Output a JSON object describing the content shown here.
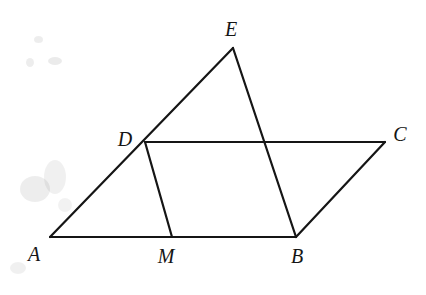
{
  "figure": {
    "canvas": {
      "width": 426,
      "height": 295,
      "background": "#ffffff"
    },
    "stroke_color": "#151515",
    "stroke_width": 2.2,
    "points": {
      "A": {
        "label": "A",
        "x": 50,
        "y": 237,
        "label_x": 34,
        "label_y": 254
      },
      "B": {
        "label": "B",
        "x": 296,
        "y": 237,
        "label_x": 297,
        "label_y": 256
      },
      "C": {
        "label": "C",
        "x": 385,
        "y": 142,
        "label_x": 400,
        "label_y": 134
      },
      "D": {
        "label": "D",
        "x": 145,
        "y": 142,
        "label_x": 125,
        "label_y": 139
      },
      "E": {
        "label": "E",
        "x": 233,
        "y": 48,
        "label_x": 231,
        "label_y": 29
      },
      "M": {
        "label": "M",
        "x": 172,
        "y": 237,
        "label_x": 166,
        "label_y": 256
      }
    },
    "segments": [
      {
        "name": "segment-AB",
        "from": "A",
        "to": "B"
      },
      {
        "name": "segment-AE",
        "from": "A",
        "to": "E"
      },
      {
        "name": "segment-DC",
        "from": "D",
        "to": "C"
      },
      {
        "name": "segment-BC",
        "from": "B",
        "to": "C"
      },
      {
        "name": "segment-DM",
        "from": "D",
        "to": "M"
      },
      {
        "name": "segment-EB",
        "from": "E",
        "to": "B"
      }
    ],
    "intersections": [
      {
        "name": "intersection-EB-DC",
        "x": 265,
        "y": 142
      }
    ],
    "smudges": [
      {
        "x": 34,
        "y": 36,
        "w": 9,
        "h": 7,
        "opacity": 0.07
      },
      {
        "x": 26,
        "y": 58,
        "w": 8,
        "h": 9,
        "opacity": 0.07
      },
      {
        "x": 48,
        "y": 57,
        "w": 14,
        "h": 8,
        "opacity": 0.08
      },
      {
        "x": 20,
        "y": 176,
        "w": 30,
        "h": 26,
        "opacity": 0.07
      },
      {
        "x": 44,
        "y": 160,
        "w": 22,
        "h": 34,
        "opacity": 0.06
      },
      {
        "x": 10,
        "y": 262,
        "w": 16,
        "h": 12,
        "opacity": 0.06
      },
      {
        "x": 58,
        "y": 198,
        "w": 14,
        "h": 14,
        "opacity": 0.05
      }
    ]
  }
}
